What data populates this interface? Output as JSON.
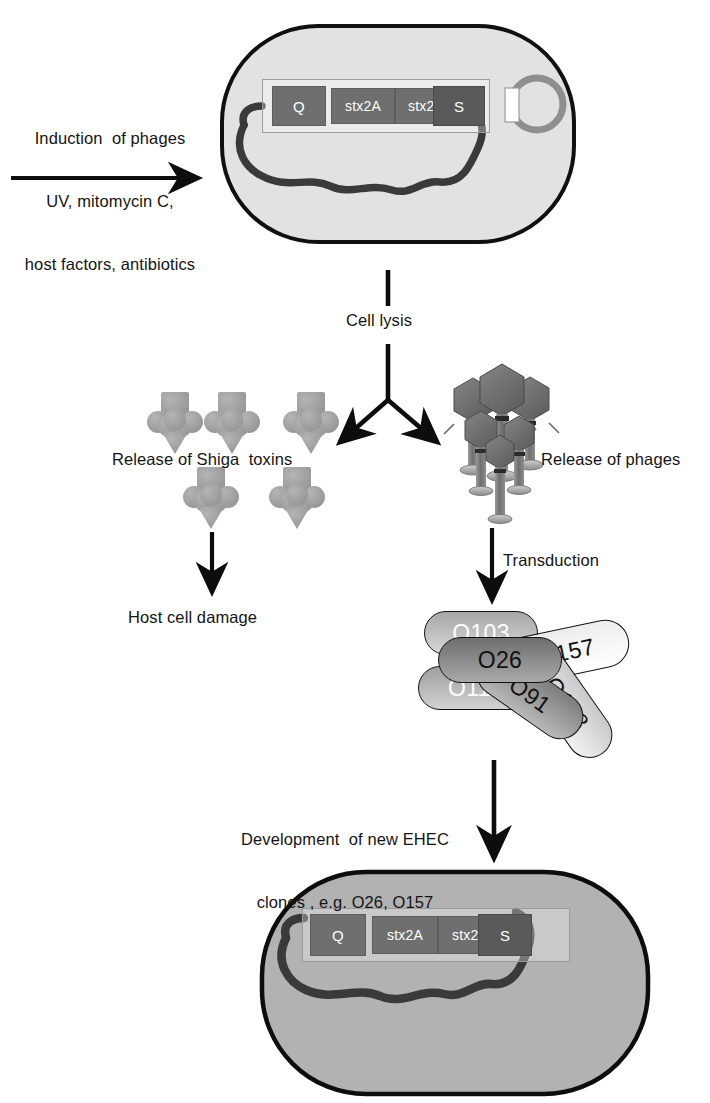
{
  "figure": {
    "type": "diagram"
  },
  "induction": {
    "line1": "Induction  of phages",
    "line2": "UV, mitomycin C,",
    "line3": "host factors, antibiotics"
  },
  "top_cell": {
    "name": "EHEC bacterial cell",
    "fill": "#e2e2e2",
    "stroke": "#101010",
    "chromosome_color": "#3a3a3a",
    "prophage_region_label": "prophage region",
    "genes": [
      {
        "label": "Q",
        "width": 52
      },
      {
        "label": "stx2A",
        "width": 62
      },
      {
        "label": "stx2B",
        "width": 60
      },
      {
        "label": "S",
        "width": 50
      }
    ],
    "plasmid": {
      "name": "plasmid",
      "color": "#8f8f8f"
    }
  },
  "cell_lysis": {
    "label": "Cell lysis"
  },
  "toxins": {
    "label": "Release of Shiga  toxins",
    "color": "#9d9d9d",
    "count": 5
  },
  "phages": {
    "label": "Release of phages",
    "color": "#6e6e6e",
    "count": 6
  },
  "host_damage": {
    "label": "Host cell damage"
  },
  "transduction": {
    "label": "Transduction"
  },
  "serotypes": {
    "items": [
      {
        "label": "O103",
        "text_color": "#ffffff",
        "fill_from": "#a7a7a7",
        "fill_to": "#d8d8d8",
        "rotate": 0
      },
      {
        "label": "O111",
        "text_color": "#ffffff",
        "fill_from": "#9f9f9f",
        "fill_to": "#d2d2d2",
        "rotate": 0
      },
      {
        "label": "O26",
        "text_color": "#111111",
        "fill_from": "#6e6e6e",
        "fill_to": "#a9a9a9",
        "rotate": 0
      },
      {
        "label": "O157",
        "text_color": "#111111",
        "fill_from": "#ededed",
        "fill_to": "#ffffff",
        "rotate": -12
      },
      {
        "label": "O91",
        "text_color": "#111111",
        "fill_from": "#7d7d7d",
        "fill_to": "#b8b8b8",
        "rotate": 35
      },
      {
        "label": "O128",
        "text_color": "#111111",
        "fill_from": "#c9c9c9",
        "fill_to": "#f2f2f2",
        "rotate": 55
      }
    ]
  },
  "development": {
    "line1": "Development  of new EHEC",
    "line2": "clones , e.g. O26, O157"
  },
  "bottom_cell": {
    "name": "new EHEC clone",
    "fill": "#b2b2b2",
    "stroke": "#0d0d0d",
    "chromosome_color": "#3a3a3a",
    "genes": [
      {
        "label": "Q",
        "width": 52
      },
      {
        "label": "stx2A",
        "width": 62
      },
      {
        "label": "stx2B",
        "width": 60
      },
      {
        "label": "S",
        "width": 50
      }
    ]
  }
}
